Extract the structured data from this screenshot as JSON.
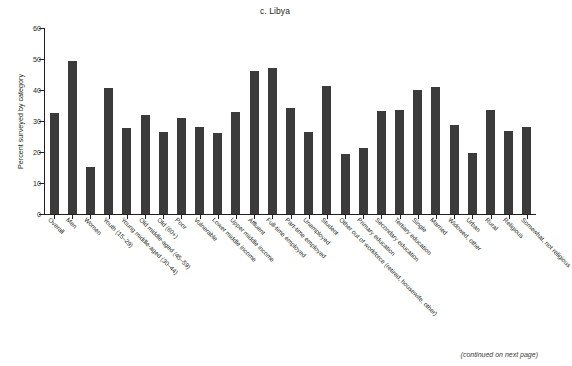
{
  "figure": {
    "title": "c. Libya",
    "footer_note": "(continued on next page)"
  },
  "chart_data": {
    "type": "bar",
    "title": "c. Libya",
    "xlabel": "",
    "ylabel": "Percent surveyed by category",
    "ylim": [
      0,
      60
    ],
    "yticks": [
      0,
      10,
      20,
      30,
      40,
      50,
      60
    ],
    "grid": false,
    "legend": null,
    "bar_color": "#3b3b3b",
    "categories": [
      "Overall",
      "Men",
      "Women",
      "Youth (15–29)",
      "Young middle-aged (30–44)",
      "Old middle-aged (45–59)",
      "Old (60+)",
      "Poor",
      "Vulnerable",
      "Lower middle income",
      "Upper middle income",
      "Affluent",
      "Full-time employed",
      "Part-time employed",
      "Unemployed",
      "Student",
      "Other out of workforce (retired, housewife, other)",
      "Primary education",
      "Secondary education",
      "Tertiary education",
      "Single",
      "Married",
      "Widowed, other",
      "Urban",
      "Rural",
      "Religious",
      "Somewhat, not religious"
    ],
    "values": [
      32.5,
      49.5,
      15.2,
      40.6,
      27.7,
      31.8,
      26.3,
      31.0,
      28.1,
      26.0,
      32.8,
      46.0,
      47.0,
      34.2,
      26.6,
      41.2,
      19.3,
      21.3,
      33.3,
      33.5,
      40.0,
      41.0,
      28.7,
      19.6,
      33.5,
      26.8,
      28.2
    ],
    "last_value": 34.3
  }
}
